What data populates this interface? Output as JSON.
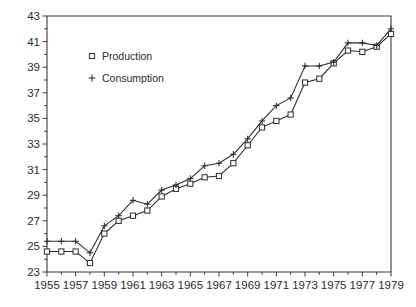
{
  "chart_data": {
    "type": "line",
    "title": "",
    "subtitle": "",
    "xlabel": "",
    "ylabel": "",
    "xlim": [
      1955,
      1979
    ],
    "ylim": [
      23,
      43
    ],
    "grid": false,
    "legend_position": "upper-left-inside",
    "y_ticks": [
      23,
      25,
      27,
      29,
      31,
      33,
      35,
      37,
      39,
      41,
      43
    ],
    "y_tick_labels": [
      "23",
      "25",
      "27",
      "29",
      "31",
      "33",
      "35",
      "37",
      "39",
      "41",
      "43"
    ],
    "y_minor_tick_interval": 1,
    "x_ticks": [
      1955,
      1957,
      1959,
      1961,
      1963,
      1965,
      1967,
      1969,
      1971,
      1973,
      1975,
      1977,
      1979
    ],
    "x_tick_labels": [
      "1955",
      "1957",
      "1959",
      "1961",
      "1963",
      "1965",
      "1967",
      "1969",
      "1971",
      "1973",
      "1975",
      "1977",
      "1979"
    ],
    "x_minor_tick_interval": 1,
    "x": [
      1955,
      1956,
      1957,
      1958,
      1959,
      1960,
      1961,
      1962,
      1963,
      1964,
      1965,
      1966,
      1967,
      1968,
      1969,
      1970,
      1971,
      1972,
      1973,
      1974,
      1975,
      1976,
      1977,
      1978,
      1979
    ],
    "series": [
      {
        "name": "Production",
        "marker": "square",
        "values": [
          24.6,
          24.6,
          24.6,
          23.7,
          26.0,
          27.0,
          27.4,
          27.8,
          28.9,
          29.5,
          29.9,
          30.4,
          30.5,
          31.5,
          32.9,
          34.3,
          34.8,
          35.3,
          37.8,
          38.1,
          39.3,
          40.3,
          40.2,
          40.6,
          41.6
        ]
      },
      {
        "name": "Consumption",
        "marker": "plus",
        "values": [
          25.4,
          25.4,
          25.4,
          24.5,
          26.6,
          27.4,
          28.6,
          28.3,
          29.4,
          29.8,
          30.3,
          31.3,
          31.5,
          32.2,
          33.4,
          34.8,
          36.0,
          36.6,
          39.1,
          39.1,
          39.4,
          40.9,
          40.9,
          40.7,
          42.0
        ]
      }
    ]
  },
  "legend": {
    "items": [
      {
        "label": "Production",
        "marker": "square"
      },
      {
        "label": "Consumption",
        "marker": "plus"
      }
    ]
  }
}
